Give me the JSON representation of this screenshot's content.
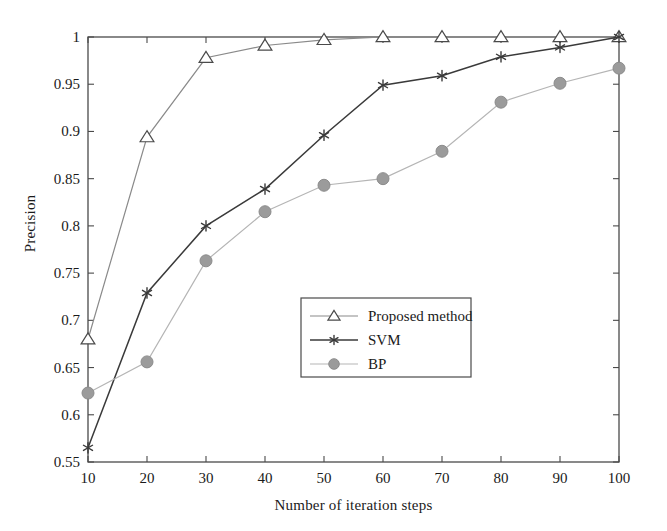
{
  "chart_data": {
    "type": "line",
    "title": "",
    "xlabel": "Number of iteration steps",
    "ylabel": "Precision",
    "x": [
      10,
      20,
      30,
      40,
      50,
      60,
      70,
      80,
      90,
      100
    ],
    "xlim": [
      10,
      100
    ],
    "ylim": [
      0.55,
      1.0
    ],
    "xticks": [
      10,
      20,
      30,
      40,
      50,
      60,
      70,
      80,
      90,
      100
    ],
    "xtick_labels": [
      "10",
      "20",
      "30",
      "40",
      "50",
      "60",
      "70",
      "80",
      "90",
      "100"
    ],
    "yticks": [
      0.55,
      0.6,
      0.65,
      0.7,
      0.75,
      0.8,
      0.85,
      0.9,
      0.95,
      1.0
    ],
    "ytick_labels": [
      "0.55",
      "0.6",
      "0.65",
      "0.7",
      "0.75",
      "0.8",
      "0.85",
      "0.9",
      "0.95",
      "1"
    ],
    "grid": false,
    "legend_position": "center",
    "series": [
      {
        "name": "Proposed method",
        "marker": "triangle-open",
        "color": "#8a8a8a",
        "line_color": "#8a8a8a",
        "values": [
          0.68,
          0.894,
          0.978,
          0.991,
          0.997,
          1.0,
          1.0,
          1.0,
          1.0,
          1.0
        ]
      },
      {
        "name": "SVM",
        "marker": "asterisk",
        "color": "#3a3a3a",
        "line_color": "#3a3a3a",
        "values": [
          0.565,
          0.729,
          0.8,
          0.839,
          0.896,
          0.949,
          0.959,
          0.979,
          0.989,
          1.0
        ]
      },
      {
        "name": "BP",
        "marker": "circle-filled",
        "color": "#9b9b9b",
        "line_color": "#b5b5b5",
        "values": [
          0.623,
          0.656,
          0.763,
          0.815,
          0.843,
          0.85,
          0.879,
          0.931,
          0.951,
          0.967
        ]
      }
    ]
  },
  "legend": {
    "entries": [
      {
        "label": "Proposed method"
      },
      {
        "label": "SVM"
      },
      {
        "label": "BP"
      }
    ]
  },
  "axes": {
    "ylabel": "Precision",
    "xlabel": "Number of iteration steps"
  },
  "colors": {
    "axis": "#4a4a4a",
    "proposed": "#8a8a8a",
    "svm": "#3a3a3a",
    "bp": "#9b9b9b",
    "background": "#ffffff"
  }
}
